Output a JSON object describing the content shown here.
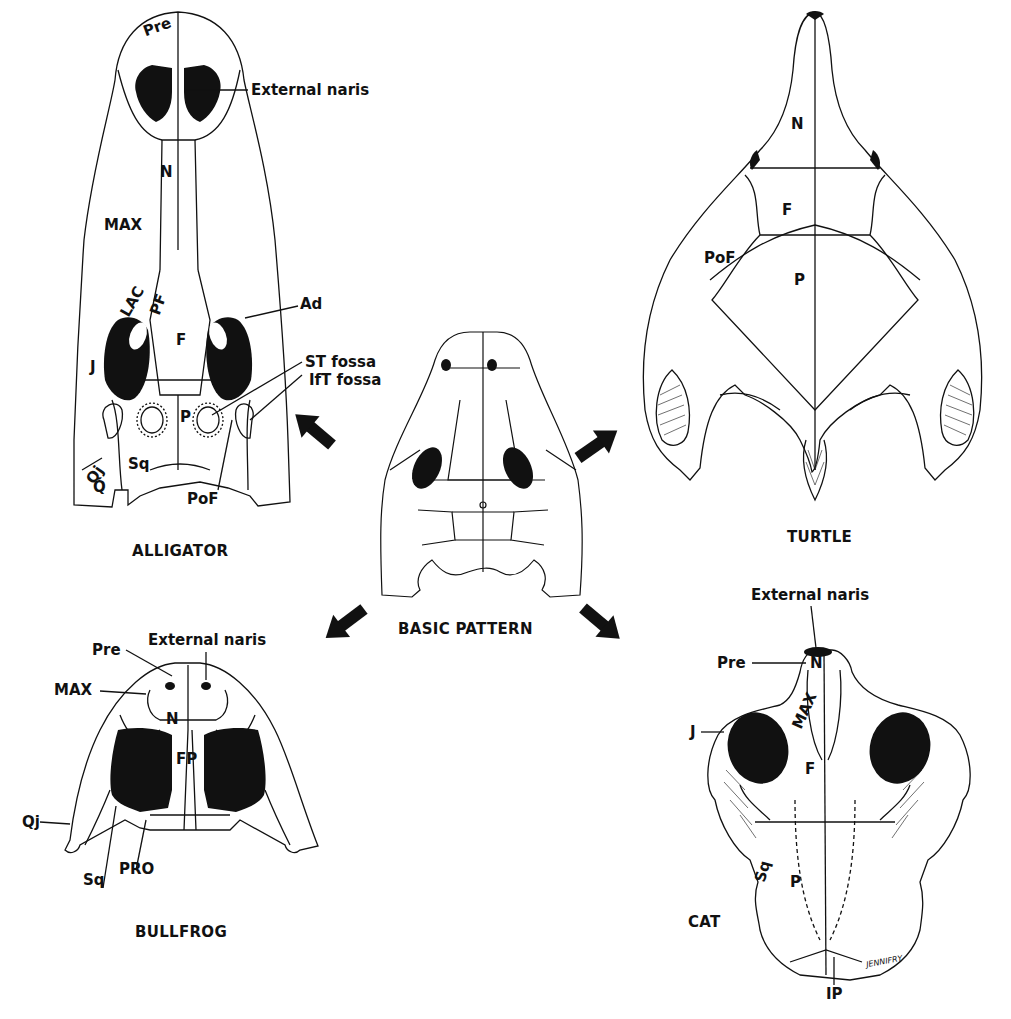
{
  "figure": {
    "center": {
      "caption": "BASIC PATTERN"
    },
    "alligator": {
      "caption": "ALLIGATOR",
      "labels": {
        "pre": "Pre",
        "external_naris": "External naris",
        "n": "N",
        "max": "MAX",
        "lac": "LAC",
        "pf": "PF",
        "ad": "Ad",
        "f": "F",
        "j": "J",
        "st_fossa": "ST fossa",
        "ift_fossa": "IfT fossa",
        "p": "P",
        "qj": "Qj",
        "sq": "Sq",
        "q": "Q",
        "pof": "PoF"
      }
    },
    "turtle": {
      "caption": "TURTLE",
      "labels": {
        "n": "N",
        "f": "F",
        "pof": "PoF",
        "p": "P"
      }
    },
    "bullfrog": {
      "caption": "BULLFROG",
      "labels": {
        "pre": "Pre",
        "external_naris": "External naris",
        "max": "MAX",
        "n": "N",
        "fp": "FP",
        "qj": "Qj",
        "sq": "Sq",
        "pro": "PRO"
      }
    },
    "cat": {
      "caption": "CAT",
      "labels": {
        "external_naris": "External naris",
        "pre": "Pre",
        "n": "N",
        "max": "MAX",
        "j": "J",
        "f": "F",
        "sq": "Sq",
        "p": "P",
        "ip": "IP"
      },
      "signature": "JENNIFRY"
    },
    "arrows": [
      {
        "direction": "up-left",
        "target": "alligator"
      },
      {
        "direction": "up-right",
        "target": "turtle"
      },
      {
        "direction": "down-left",
        "target": "bullfrog"
      },
      {
        "direction": "down-right",
        "target": "cat"
      }
    ],
    "colors": {
      "ink": "#111111",
      "paper": "#ffffff"
    }
  }
}
